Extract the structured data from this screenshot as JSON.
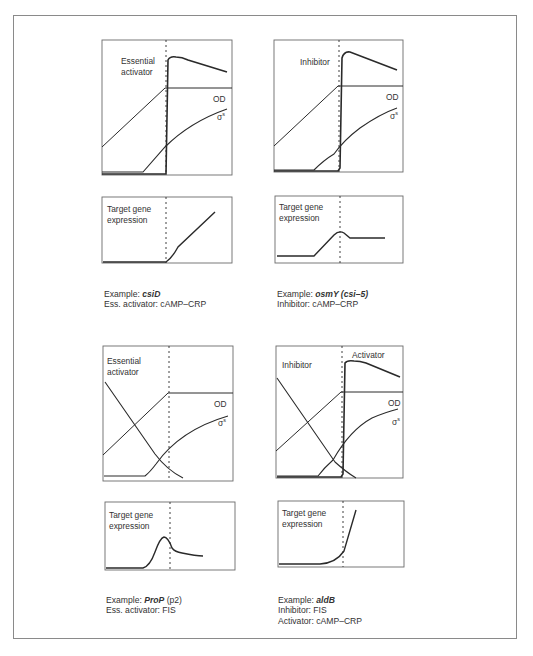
{
  "figure": {
    "panels": [
      {
        "id": "top-left",
        "top_chart": {
          "labels": [
            "Essential",
            "activator"
          ],
          "od_label": "OD",
          "sigma_label": "σ",
          "sigma_sup": "s"
        },
        "bottom_chart": {
          "labels": [
            "Target gene",
            "expression"
          ]
        },
        "caption": {
          "line1_prefix": "Example: ",
          "line1_gene": "csiD",
          "line1_suffix": "",
          "line2": "Ess. activator: cAMP–CRP",
          "line3": ""
        }
      },
      {
        "id": "top-right",
        "top_chart": {
          "labels": [
            "Inhibitor"
          ],
          "od_label": "OD",
          "sigma_label": "σ",
          "sigma_sup": "s"
        },
        "bottom_chart": {
          "labels": [
            "Target gene",
            "expression"
          ]
        },
        "caption": {
          "line1_prefix": "Example: ",
          "line1_gene": "osmY (csi–5)",
          "line1_suffix": "",
          "line2": "Inhibitor: cAMP–CRP",
          "line3": ""
        }
      },
      {
        "id": "bottom-left",
        "top_chart": {
          "labels": [
            "Essential",
            "activator"
          ],
          "od_label": "OD",
          "sigma_label": "σ",
          "sigma_sup": "s"
        },
        "bottom_chart": {
          "labels": [
            "Target gene",
            "expression"
          ]
        },
        "caption": {
          "line1_prefix": "Example: ",
          "line1_gene": "ProP",
          "line1_suffix": " (p2)",
          "line2": "Ess. activator: FIS",
          "line3": ""
        }
      },
      {
        "id": "bottom-right",
        "top_chart": {
          "labels": [
            "Inhibitor"
          ],
          "activator_label": "Activator",
          "od_label": "OD",
          "sigma_label": "σ",
          "sigma_sup": "s"
        },
        "bottom_chart": {
          "labels": [
            "Target gene",
            "expression"
          ]
        },
        "caption": {
          "line1_prefix": "Example: ",
          "line1_gene": "aldB",
          "line1_suffix": "",
          "line2": "Inhibitor: FIS",
          "line3": "Activator: cAMP–CRP"
        }
      }
    ],
    "colors": {
      "line": "#2a2a2a",
      "frame": "#8a8a8a",
      "axis": "#6a6a6a"
    }
  }
}
